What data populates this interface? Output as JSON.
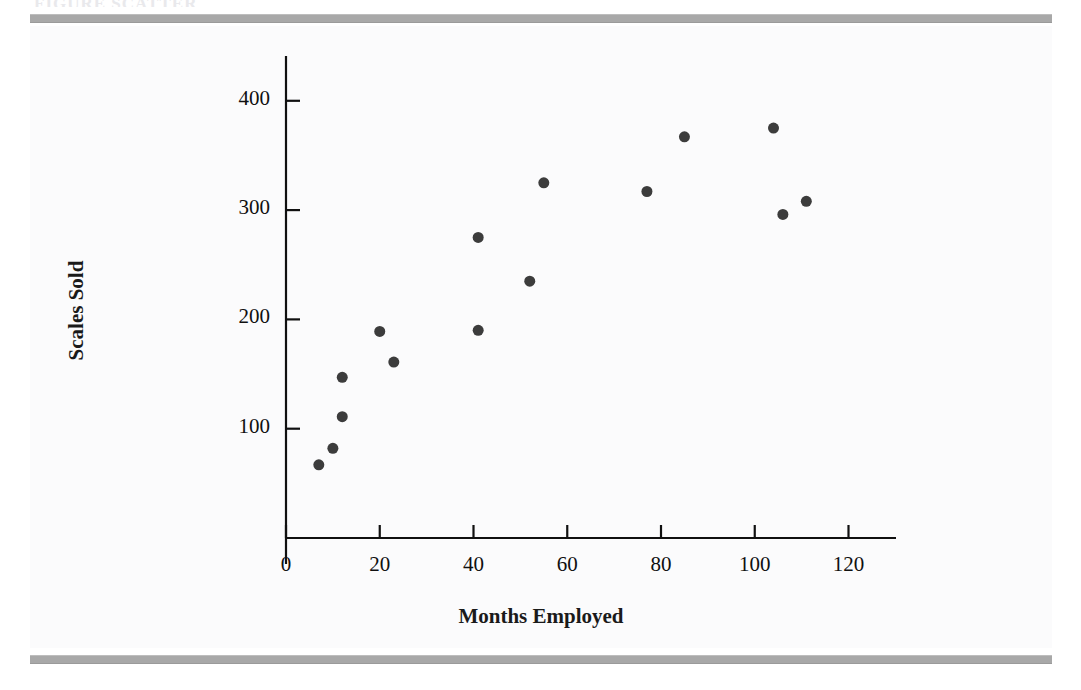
{
  "page": {
    "background_color": "#ffffff",
    "rule_color": "#a8a8a8",
    "header_sliver_text": "FIGURE    SCATTER"
  },
  "chart_data": {
    "type": "scatter",
    "title": "",
    "subtitle": "",
    "xlabel": "Months Employed",
    "ylabel": "Scales Sold",
    "xlim": [
      0,
      128
    ],
    "ylim": [
      0,
      430
    ],
    "xticks": [
      0,
      20,
      40,
      60,
      80,
      100,
      120
    ],
    "xtick_labels": [
      "0",
      "20",
      "40",
      "60",
      "80",
      "100",
      "120"
    ],
    "yticks": [
      100,
      200,
      300,
      400
    ],
    "ytick_labels": [
      "100",
      "200",
      "300",
      "400"
    ],
    "grid": false,
    "legend": null,
    "marker_color": "#3c3c3c",
    "marker_size": 11,
    "axis_color": "#101010",
    "series": [
      {
        "name": "Salespersons",
        "points": [
          {
            "x": 7,
            "y": 67
          },
          {
            "x": 10,
            "y": 82
          },
          {
            "x": 12,
            "y": 111
          },
          {
            "x": 12,
            "y": 147
          },
          {
            "x": 20,
            "y": 189
          },
          {
            "x": 23,
            "y": 161
          },
          {
            "x": 41,
            "y": 190
          },
          {
            "x": 41,
            "y": 275
          },
          {
            "x": 52,
            "y": 235
          },
          {
            "x": 55,
            "y": 325
          },
          {
            "x": 77,
            "y": 317
          },
          {
            "x": 85,
            "y": 367
          },
          {
            "x": 104,
            "y": 375
          },
          {
            "x": 106,
            "y": 296
          },
          {
            "x": 111,
            "y": 308
          }
        ]
      }
    ]
  }
}
